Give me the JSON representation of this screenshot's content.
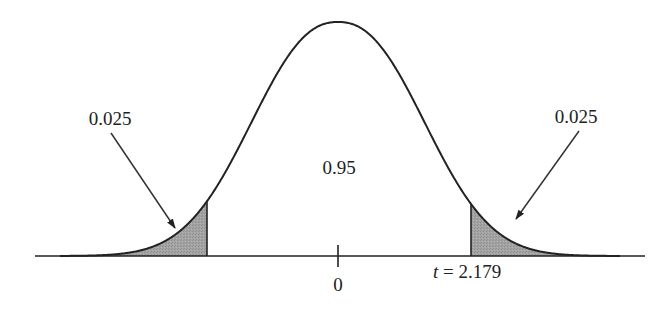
{
  "chart_data": {
    "type": "area",
    "title": "",
    "xlabel": "",
    "ylabel": "",
    "distribution": "t-distribution (bell curve)",
    "center_label": "0",
    "critical_value_label": "t = 2.179",
    "critical_value": 2.179,
    "regions": [
      {
        "name": "left-tail",
        "area": 0.025,
        "label": "0.025",
        "range": [
          null,
          -2.179
        ],
        "shaded": true
      },
      {
        "name": "center",
        "area": 0.95,
        "label": "0.95",
        "range": [
          -2.179,
          2.179
        ],
        "shaded": false
      },
      {
        "name": "right-tail",
        "area": 0.025,
        "label": "0.025",
        "range": [
          2.179,
          null
        ],
        "shaded": true
      }
    ],
    "annotations": [
      {
        "text": "0.025",
        "points_to": "left-tail",
        "arrow": true
      },
      {
        "text": "0.95",
        "points_to": "center",
        "arrow": false
      },
      {
        "text": "0.025",
        "points_to": "right-tail",
        "arrow": true
      }
    ],
    "grid": false,
    "legend": null
  },
  "labels": {
    "left_tail": "0.025",
    "right_tail": "0.025",
    "center_area": "0.95",
    "zero_tick": "0",
    "t_symbol": "t",
    "t_value": " = 2.179"
  },
  "colors": {
    "line": "#222222",
    "shade": "#a3a3a3",
    "background": "#ffffff"
  },
  "geometry": {
    "baseline_y": 256,
    "peak_y": 22,
    "center_x": 338,
    "x_start": 35,
    "x_end": 645,
    "left_cut_x": 207,
    "right_cut_x": 471,
    "shape_a": 111.4,
    "shape_p": 2.3,
    "left_arrow": {
      "x1": 111,
      "y1": 133,
      "x2": 175,
      "y2": 228
    },
    "right_arrow": {
      "x1": 579,
      "y1": 131,
      "x2": 516,
      "y2": 219
    }
  }
}
